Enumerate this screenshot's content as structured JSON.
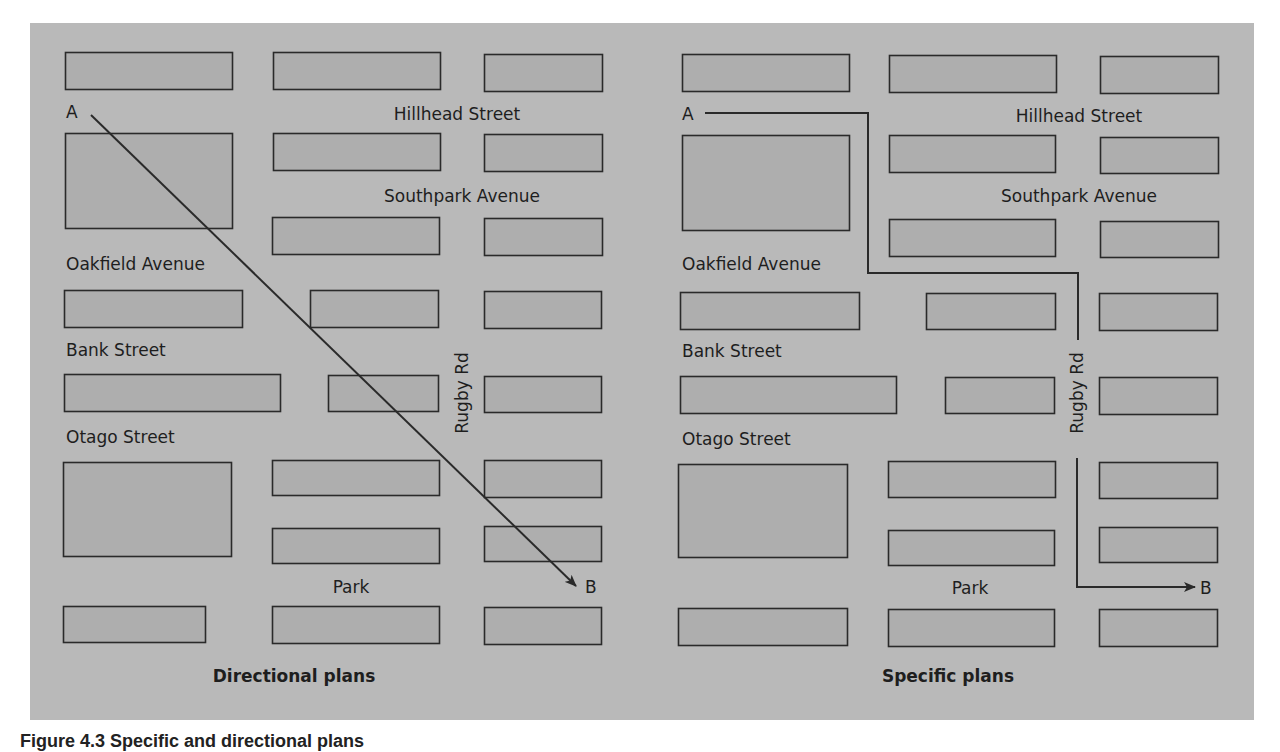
{
  "colors": {
    "background": "#b9b9b9",
    "block_fill": "#aeaeae",
    "stroke": "#2a2a2a",
    "text": "#1e1e1e"
  },
  "caption": "Figure 4.3 Specific and directional plans",
  "panels": [
    {
      "id": "directional",
      "title": "Directional plans",
      "title_pos": [
        294,
        682
      ],
      "streets": [
        {
          "label": "Hillhead Street",
          "x": 457,
          "y": 120,
          "anchor": "middle"
        },
        {
          "label": "Southpark Avenue",
          "x": 462,
          "y": 202,
          "anchor": "middle"
        },
        {
          "label": "Oakfield Avenue",
          "x": 66,
          "y": 270,
          "anchor": "start"
        },
        {
          "label": "Bank Street",
          "x": 66,
          "y": 356,
          "anchor": "start"
        },
        {
          "label": "Otago Street",
          "x": 66,
          "y": 443,
          "anchor": "start"
        },
        {
          "label": "Park",
          "x": 351,
          "y": 593,
          "anchor": "middle"
        }
      ],
      "rotated_street": {
        "label": "Rugby Rd",
        "x": 462,
        "y": 393
      },
      "point_a": {
        "label": "A",
        "x": 66,
        "y": 118
      },
      "point_b": {
        "label": "B",
        "x": 585,
        "y": 593
      },
      "route": {
        "type": "direct",
        "points": [
          [
            91,
            115
          ],
          [
            576,
            586
          ]
        ]
      },
      "blocks": [
        [
          65,
          52,
          167,
          37
        ],
        [
          273,
          52,
          167,
          37
        ],
        [
          484,
          54,
          118,
          37
        ],
        [
          65,
          133,
          167,
          95
        ],
        [
          273,
          133,
          167,
          37
        ],
        [
          484,
          134,
          118,
          37
        ],
        [
          272,
          217,
          167,
          37
        ],
        [
          484,
          218,
          118,
          37
        ],
        [
          64,
          290,
          178,
          37
        ],
        [
          310,
          290,
          128,
          37
        ],
        [
          484,
          291,
          117,
          37
        ],
        [
          64,
          374,
          216,
          37
        ],
        [
          328,
          375,
          110,
          36
        ],
        [
          484,
          376,
          117,
          36
        ],
        [
          63,
          462,
          168,
          94
        ],
        [
          272,
          460,
          167,
          35
        ],
        [
          484,
          460,
          117,
          37
        ],
        [
          272,
          528,
          167,
          35
        ],
        [
          484,
          526,
          117,
          35
        ],
        [
          63,
          606,
          142,
          36
        ],
        [
          272,
          606,
          167,
          37
        ],
        [
          484,
          607,
          117,
          37
        ]
      ]
    },
    {
      "id": "specific",
      "title": "Specific plans",
      "title_pos": [
        948,
        682
      ],
      "streets": [
        {
          "label": "Hillhead Street",
          "x": 1079,
          "y": 122,
          "anchor": "middle"
        },
        {
          "label": "Southpark Avenue",
          "x": 1079,
          "y": 202,
          "anchor": "middle"
        },
        {
          "label": "Oakfield Avenue",
          "x": 682,
          "y": 270,
          "anchor": "start"
        },
        {
          "label": "Bank Street",
          "x": 682,
          "y": 357,
          "anchor": "start"
        },
        {
          "label": "Otago Street",
          "x": 682,
          "y": 445,
          "anchor": "start"
        },
        {
          "label": "Park",
          "x": 970,
          "y": 594,
          "anchor": "middle"
        }
      ],
      "rotated_street": {
        "label": "Rugby Rd",
        "x": 1077,
        "y": 393
      },
      "point_a": {
        "label": "A",
        "x": 682,
        "y": 120
      },
      "point_b": {
        "label": "B",
        "x": 1200,
        "y": 594
      },
      "route": {
        "type": "specific",
        "segments": [
          [
            [
              705,
              113
            ],
            [
              868,
              113
            ],
            [
              868,
              273
            ],
            [
              1078,
              273
            ],
            [
              1078,
              340
            ]
          ],
          [
            [
              1077,
              458
            ],
            [
              1077,
              587
            ],
            [
              1195,
              587
            ]
          ]
        ]
      },
      "blocks": [
        [
          682,
          54,
          167,
          37
        ],
        [
          889,
          55,
          167,
          37
        ],
        [
          1100,
          56,
          118,
          37
        ],
        [
          682,
          135,
          167,
          95
        ],
        [
          889,
          135,
          166,
          37
        ],
        [
          1100,
          137,
          118,
          36
        ],
        [
          889,
          219,
          166,
          37
        ],
        [
          1100,
          221,
          118,
          36
        ],
        [
          680,
          292,
          179,
          37
        ],
        [
          926,
          293,
          129,
          36
        ],
        [
          1099,
          293,
          118,
          37
        ],
        [
          680,
          376,
          216,
          37
        ],
        [
          945,
          377,
          109,
          36
        ],
        [
          1099,
          377,
          118,
          37
        ],
        [
          678,
          464,
          169,
          93
        ],
        [
          888,
          461,
          167,
          36
        ],
        [
          1099,
          462,
          118,
          36
        ],
        [
          888,
          530,
          166,
          35
        ],
        [
          1099,
          527,
          118,
          35
        ],
        [
          678,
          608,
          169,
          37
        ],
        [
          888,
          609,
          166,
          37
        ],
        [
          1099,
          609,
          118,
          37
        ]
      ]
    }
  ]
}
